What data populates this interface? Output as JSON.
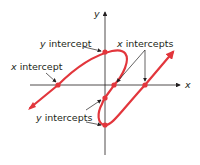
{
  "diagram": {
    "axes": {
      "x_label": "x",
      "y_label": "y"
    },
    "labels": {
      "y_intercept_top": {
        "var": "y",
        "text": " intercept"
      },
      "x_intercept_left": {
        "var": "x",
        "text": " intercept"
      },
      "x_intercepts": {
        "var": "x",
        "text": " intercepts"
      },
      "y_intercepts": {
        "var": "y",
        "text": " intercepts"
      }
    },
    "colors": {
      "curve": "#e2363c",
      "axis": "#231f20",
      "text": "#231f20"
    }
  }
}
